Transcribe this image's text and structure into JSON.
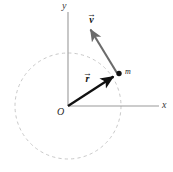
{
  "figure": {
    "background_color": "#ffffff"
  },
  "axes": {
    "x_label": "x",
    "y_label": "y",
    "origin_label": "O",
    "color": "#9a9a9a",
    "x_axis": {
      "x1": 68,
      "y1": 106,
      "x2": 159,
      "y2": 106
    },
    "y_axis": {
      "x1": 68,
      "y1": 12,
      "x2": 68,
      "y2": 106
    }
  },
  "circle": {
    "name": "orbit-path",
    "center_x": 68,
    "center_y": 106,
    "radius": 53,
    "style": "dashed",
    "color": "#c9c9c9"
  },
  "point_mass": {
    "label": "m",
    "x": 119,
    "y": 74,
    "color": "#111111",
    "radius": 2.6
  },
  "vectors": [
    {
      "name": "position-vector",
      "label": "r",
      "accent": "arrow",
      "color": "#111111",
      "from_x": 68,
      "from_y": 106,
      "to_x": 117,
      "to_y": 75,
      "label_x": 83,
      "label_y": 71
    },
    {
      "name": "velocity-vector",
      "label": "v",
      "accent": "arrow",
      "color": "#6b6b6b",
      "from_x": 117,
      "from_y": 73,
      "to_x": 89,
      "to_y": 27,
      "label_x": 87,
      "label_y": 12
    }
  ],
  "labels": {
    "y": "y",
    "x": "x",
    "O": "O",
    "m": "m",
    "v": "v",
    "r": "r",
    "harpoon": "→"
  },
  "colors": {
    "axis": "#9a9a9a",
    "circle": "#c9c9c9",
    "position_vector": "#111111",
    "velocity_vector": "#6b6b6b",
    "text": "#1a1a1a"
  }
}
